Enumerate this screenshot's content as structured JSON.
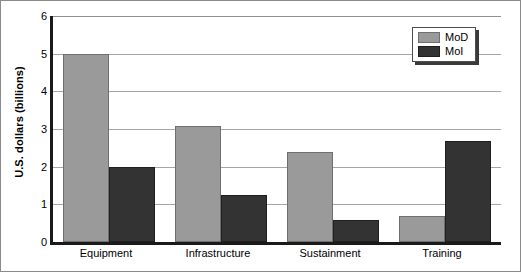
{
  "chart_data": {
    "type": "bar",
    "title": "",
    "xlabel": "",
    "ylabel": "U.S. dollars (billions)",
    "categories": [
      "Equipment",
      "Infrastructure",
      "Sustainment",
      "Training"
    ],
    "series": [
      {
        "name": "MoD",
        "color": "#9a9a9a",
        "values": [
          5.0,
          3.07,
          2.38,
          0.7
        ]
      },
      {
        "name": "MoI",
        "color": "#333333",
        "values": [
          2.0,
          1.25,
          0.58,
          2.68
        ]
      }
    ],
    "ylim": [
      0,
      6
    ],
    "yticks": [
      0,
      1,
      2,
      3,
      4,
      5,
      6
    ],
    "ytick_labels": [
      "0",
      "1",
      "2",
      "3",
      "4",
      "5",
      "6"
    ],
    "grid": true,
    "grid_axis": "y",
    "legend_position": "top-right",
    "legend_entries": [
      "MoD",
      "MoI"
    ]
  }
}
